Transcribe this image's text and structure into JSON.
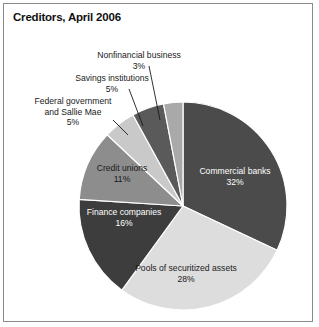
{
  "chart_data": {
    "type": "pie",
    "title": "Creditors, April 2006",
    "xlabel": "",
    "ylabel": "",
    "legend_position": "none",
    "grid": false,
    "total_percent": 100,
    "categories": [
      "Commercial banks",
      "Pools of securitized assets",
      "Finance companies",
      "Credit unions",
      "Federal government and Sallie Mae",
      "Savings institutions",
      "Nonfinancial business"
    ],
    "values": [
      32,
      28,
      16,
      11,
      5,
      5,
      3
    ],
    "slices": [
      {
        "label": "Commercial banks",
        "percent_text": "32%",
        "value": 32,
        "color": "#4b4b4b",
        "label_color": "#ffffff",
        "label_placement": "inside"
      },
      {
        "label": "Pools of securitized assets",
        "percent_text": "28%",
        "value": 28,
        "color": "#dddddd",
        "label_color": "#1a1a1a",
        "label_placement": "inside"
      },
      {
        "label": "Finance companies",
        "percent_text": "16%",
        "value": 16,
        "color": "#3d3d3d",
        "label_color": "#ffffff",
        "label_placement": "inside"
      },
      {
        "label": "Credit unions",
        "percent_text": "11%",
        "value": 11,
        "color": "#8d8d8d",
        "label_color": "#1a1a1a",
        "label_placement": "inside"
      },
      {
        "label": "Federal government and Sallie Mae",
        "percent_text": "5%",
        "value": 5,
        "color": "#c9c9c9",
        "label_color": "#1a1a1a",
        "label_placement": "outside-leader"
      },
      {
        "label": "Savings institutions",
        "percent_text": "5%",
        "value": 5,
        "color": "#5a5a5a",
        "label_color": "#1a1a1a",
        "label_placement": "outside-leader"
      },
      {
        "label": "Nonfinancial business",
        "percent_text": "3%",
        "value": 3,
        "color": "#a9a9a9",
        "label_color": "#1a1a1a",
        "label_placement": "outside-leader"
      }
    ],
    "geometry": {
      "center_x": 183,
      "center_y": 206,
      "radius": 104,
      "start_angle_deg": -90,
      "direction": "clockwise"
    },
    "style": {
      "background": "#ffffff",
      "frame_border": "#8a8a8a",
      "slice_outline": "#ffffff",
      "title_color": "#111111"
    }
  },
  "labels": {
    "nonfinancial": {
      "name": "Nonfinancial business",
      "pct": "3%"
    },
    "savings": {
      "name": "Savings institutions",
      "pct": "5%"
    },
    "federal_line1": "Federal government",
    "federal_line2": "and Sallie Mae",
    "federal_pct": "5%",
    "credit": {
      "name": "Credit unions",
      "pct": "11%"
    },
    "finance": {
      "name": "Finance companies",
      "pct": "16%"
    },
    "pools": {
      "name": "Pools of securitized assets",
      "pct": "28%"
    },
    "commercial": {
      "name": "Commercial banks",
      "pct": "32%"
    }
  }
}
